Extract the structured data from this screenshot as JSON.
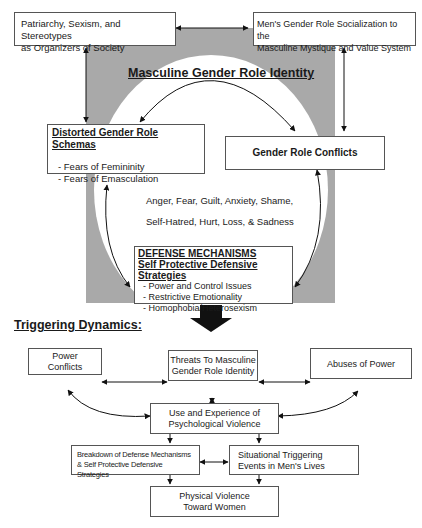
{
  "diagram": {
    "top": {
      "patriarchy": [
        "Patriarchy, Sexism, and Stereotypes",
        "as Organizers of Society"
      ],
      "socialization": [
        "Men's Gender Role Socialization to the",
        "Masculine Mystique and Value System"
      ],
      "identity_title": "Masculine Gender Role Identity",
      "schemas_title": "Distorted Gender Role Schemas",
      "schemas_items": [
        "- Fears of Femininity",
        "- Fears of Emasculation"
      ],
      "conflicts": "Gender Role Conflicts",
      "emotions_line1": "Anger, Fear, Guilt, Anxiety, Shame,",
      "emotions_line2": "Self-Hatred, Hurt, Loss, & Sadness",
      "defense_title1": "DEFENSE MECHANISMS",
      "defense_title2": "Self Protective Defensive Strategies",
      "defense_items": [
        "- Power and Control Issues",
        "- Restrictive Emotionality",
        "- Homophobia/Heterosexism"
      ]
    },
    "triggering": {
      "heading": "Triggering Dynamics:",
      "power_conflicts": [
        "Power",
        "Conflicts"
      ],
      "threats": [
        "Threats To Masculine",
        "Gender Role Identity"
      ],
      "abuses": "Abuses of Power",
      "psych_violence": [
        "Use and Experience of",
        "Psychological Violence"
      ],
      "breakdown": [
        "Breakdown of Defense Mechanisms",
        "& Self Protective Defensive Strategies"
      ],
      "situational": [
        "Situational Triggering",
        "Events in Men's Lives"
      ],
      "physical": [
        "Physical Violence",
        "Toward Women"
      ]
    },
    "colors": {
      "gray_fill": "#a9a9a9",
      "border": "#555555"
    }
  }
}
